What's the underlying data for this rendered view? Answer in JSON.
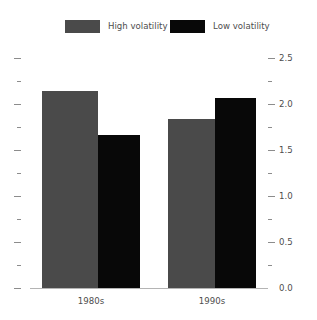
{
  "chart_data": {
    "type": "bar",
    "title": "",
    "subtitle": "",
    "xlabel": "",
    "ylabel": "",
    "categories": [
      "1980s",
      "1990s"
    ],
    "series": [
      {
        "name": "High volatility",
        "color": "#4a4a4a",
        "values": [
          2.14,
          1.84
        ]
      },
      {
        "name": "Low volatility",
        "color": "#080808",
        "values": [
          1.66,
          2.06
        ]
      }
    ],
    "ylim": [
      0.0,
      2.5
    ],
    "y_axis_side": "right",
    "y_major_ticks": [
      0.0,
      0.5,
      1.0,
      1.5,
      2.0,
      2.5
    ],
    "y_major_tick_labels": [
      "0.0",
      "0.5",
      "1.0",
      "1.5",
      "2.0",
      "2.5"
    ],
    "y_minor_ticks": [
      0.25,
      0.75,
      1.25,
      1.75,
      2.25
    ],
    "left_axis_ticks_unlabeled": true,
    "grid": false,
    "legend_position": "top",
    "legend_entries": [
      "High volatility",
      "Low volatility"
    ]
  },
  "legend": {
    "high_label": "High volatility",
    "low_label": "Low volatility",
    "high_color": "#4a4a4a",
    "low_color": "#080808"
  },
  "axis": {
    "labels": [
      "2.5",
      "2.0",
      "1.5",
      "1.0",
      "0.5",
      "0.0"
    ]
  },
  "categories": {
    "first": "1980s",
    "second": "1990s"
  }
}
